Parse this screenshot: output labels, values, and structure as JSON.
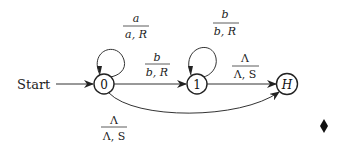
{
  "diagram": {
    "type": "turing-machine-state-diagram",
    "start_label": "Start",
    "states": [
      {
        "id": "0",
        "label": "0"
      },
      {
        "id": "1",
        "label": "1"
      },
      {
        "id": "H",
        "label": "H"
      }
    ],
    "transitions": [
      {
        "from": "0",
        "to": "0",
        "read": "a",
        "write_move": "a, R"
      },
      {
        "from": "0",
        "to": "1",
        "read": "b",
        "write_move": "b, R"
      },
      {
        "from": "1",
        "to": "1",
        "read": "b",
        "write_move": "b, R"
      },
      {
        "from": "1",
        "to": "H",
        "read": "Λ",
        "write_move": "Λ, S"
      },
      {
        "from": "0",
        "to": "H",
        "read": "Λ",
        "write_move": "Λ, S"
      }
    ],
    "end_marker": "♦"
  }
}
